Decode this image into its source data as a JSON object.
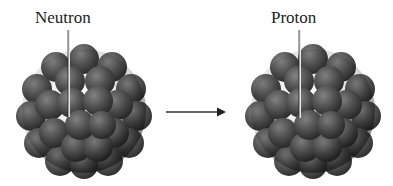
{
  "diagram": {
    "left": {
      "label": "Neutron"
    },
    "right": {
      "label": "Proton"
    },
    "arrow": {
      "direction": "right"
    },
    "colors": {
      "nucleus": "#4a4a4a",
      "highlight": "#7a7a7a",
      "line": "#e8e8e8",
      "text": "#222222"
    }
  }
}
